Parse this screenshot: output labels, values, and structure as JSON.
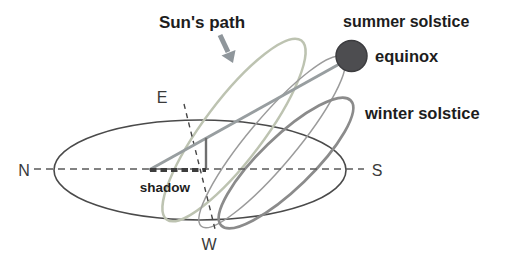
{
  "diagram": {
    "title": "Sun's path",
    "paths": [
      {
        "id": "summer",
        "label": "summer solstice",
        "color": "#bdc3b1"
      },
      {
        "id": "equinox",
        "label": "equinox",
        "color": "#9b9b9b"
      },
      {
        "id": "winter",
        "label": "winter solstice",
        "color": "#8b8b8b"
      }
    ],
    "compass": {
      "north": "N",
      "south": "S",
      "east": "E",
      "west": "W"
    },
    "shadow_label": "shadow",
    "sun": {
      "name": "sun",
      "color": "#4d4d50",
      "edge_color": "#3c3c3f"
    },
    "colors": {
      "horizon": "#4a4a4a",
      "dashed_ns": "#5a5a5a",
      "dashed_ew": "#454545",
      "sun_ray": "#989ea0",
      "gnomon": "#6f6f6f",
      "shadow": "#3d3d3d",
      "arrow": "#8f969b",
      "text": "#1d1d1d"
    }
  }
}
